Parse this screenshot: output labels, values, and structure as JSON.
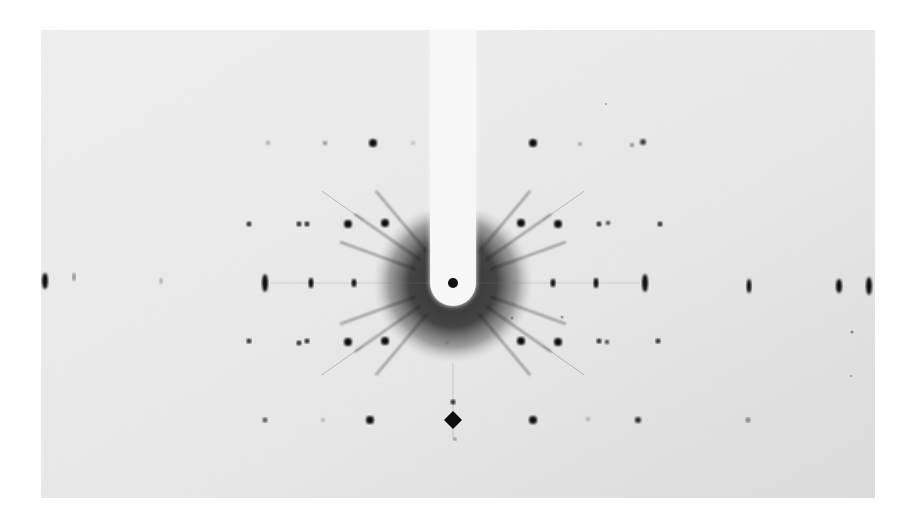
{
  "figure": {
    "kind": "x-ray diffraction photograph",
    "photo_rect": {
      "x": 41,
      "y": 30,
      "w": 834,
      "h": 468
    },
    "background_color": "#ececec",
    "page_color": "#ffffff",
    "center": {
      "x": 453,
      "y": 283
    },
    "halo": {
      "radius": 80,
      "color": "#3a3a3a"
    },
    "beam_stop": {
      "x": 453,
      "top": 30,
      "width": 46,
      "radius": 23,
      "color": "#f7f7f7"
    },
    "central_spot": {
      "x": 453,
      "y": 283,
      "r": 5
    },
    "streak_angles": [
      0,
      20,
      35,
      50,
      130,
      145,
      160,
      180,
      200,
      215,
      230,
      310,
      325,
      340
    ],
    "spots": [
      {
        "x": 268,
        "y": 143,
        "r": 2,
        "o": 0.35
      },
      {
        "x": 325,
        "y": 143,
        "r": 2,
        "o": 0.5
      },
      {
        "x": 373,
        "y": 143,
        "r": 4,
        "o": 1
      },
      {
        "x": 413,
        "y": 143,
        "r": 2,
        "o": 0.2
      },
      {
        "x": 533,
        "y": 143,
        "r": 4,
        "o": 1
      },
      {
        "x": 580,
        "y": 144,
        "r": 2,
        "o": 0.3
      },
      {
        "x": 632,
        "y": 145,
        "r": 2,
        "o": 0.5
      },
      {
        "x": 643,
        "y": 142,
        "r": 3,
        "o": 0.8
      },
      {
        "x": 249,
        "y": 224,
        "r": 2.5,
        "o": 0.9
      },
      {
        "x": 299,
        "y": 224,
        "r": 2.5,
        "o": 0.9
      },
      {
        "x": 307,
        "y": 224,
        "r": 2.5,
        "o": 0.9
      },
      {
        "x": 348,
        "y": 224,
        "r": 4,
        "o": 1
      },
      {
        "x": 385,
        "y": 223,
        "r": 4,
        "o": 1
      },
      {
        "x": 521,
        "y": 223,
        "r": 4,
        "o": 1
      },
      {
        "x": 558,
        "y": 224,
        "r": 4,
        "o": 1
      },
      {
        "x": 599,
        "y": 224,
        "r": 2.5,
        "o": 0.9
      },
      {
        "x": 608,
        "y": 223,
        "r": 2,
        "o": 0.9
      },
      {
        "x": 660,
        "y": 224,
        "r": 2.5,
        "o": 0.9
      },
      {
        "x": 249,
        "y": 341,
        "r": 2.5,
        "o": 0.9
      },
      {
        "x": 299,
        "y": 343,
        "r": 2.5,
        "o": 0.9
      },
      {
        "x": 307,
        "y": 341,
        "r": 2.5,
        "o": 0.9
      },
      {
        "x": 348,
        "y": 342,
        "r": 4,
        "o": 1
      },
      {
        "x": 385,
        "y": 341,
        "r": 4,
        "o": 1
      },
      {
        "x": 521,
        "y": 341,
        "r": 4,
        "o": 1
      },
      {
        "x": 558,
        "y": 342,
        "r": 4,
        "o": 1
      },
      {
        "x": 599,
        "y": 341,
        "r": 2.5,
        "o": 0.9
      },
      {
        "x": 607,
        "y": 342,
        "r": 2,
        "o": 0.9
      },
      {
        "x": 658,
        "y": 341,
        "r": 2.5,
        "o": 0.9
      },
      {
        "x": 447,
        "y": 343,
        "r": 2,
        "o": 0.15
      },
      {
        "x": 265,
        "y": 420,
        "r": 2.5,
        "o": 0.7
      },
      {
        "x": 323,
        "y": 420,
        "r": 2,
        "o": 0.25
      },
      {
        "x": 370,
        "y": 420,
        "r": 4,
        "o": 1
      },
      {
        "x": 533,
        "y": 420,
        "r": 4,
        "o": 1
      },
      {
        "x": 588,
        "y": 419,
        "r": 2,
        "o": 0.25
      },
      {
        "x": 638,
        "y": 420,
        "r": 3,
        "o": 0.9
      },
      {
        "x": 748,
        "y": 420,
        "r": 2.5,
        "o": 0.5
      },
      {
        "x": 453,
        "y": 402,
        "r": 2.5,
        "o": 0.9
      },
      {
        "x": 455,
        "y": 439,
        "r": 1.5,
        "o": 0.6
      }
    ],
    "elongated_spots": [
      {
        "x": 45,
        "y": 281,
        "rx": 3,
        "ry": 8,
        "o": 1
      },
      {
        "x": 74,
        "y": 277,
        "rx": 1.5,
        "ry": 4,
        "o": 0.5
      },
      {
        "x": 161,
        "y": 281,
        "rx": 1.5,
        "ry": 3,
        "o": 0.3
      },
      {
        "x": 265,
        "y": 283,
        "rx": 3,
        "ry": 9,
        "o": 1
      },
      {
        "x": 311,
        "y": 283,
        "rx": 2.5,
        "ry": 5,
        "o": 1
      },
      {
        "x": 354,
        "y": 283,
        "rx": 2.5,
        "ry": 4,
        "o": 1
      },
      {
        "x": 553,
        "y": 283,
        "rx": 2.5,
        "ry": 4,
        "o": 1
      },
      {
        "x": 596,
        "y": 283,
        "rx": 2.5,
        "ry": 5,
        "o": 1
      },
      {
        "x": 645,
        "y": 283,
        "rx": 3,
        "ry": 9,
        "o": 1
      },
      {
        "x": 749,
        "y": 286,
        "rx": 2.5,
        "ry": 7,
        "o": 1
      },
      {
        "x": 839,
        "y": 286,
        "rx": 3,
        "ry": 7,
        "o": 1
      },
      {
        "x": 869,
        "y": 286,
        "rx": 3,
        "ry": 9,
        "o": 1
      }
    ],
    "diamond_spot": {
      "x": 453,
      "y": 420,
      "size": 9
    },
    "faint_spots": [
      {
        "x": 512,
        "y": 318,
        "r": 1.5,
        "o": 0.4
      },
      {
        "x": 562,
        "y": 317,
        "r": 1.5,
        "o": 0.4
      },
      {
        "x": 852,
        "y": 332,
        "r": 1.5,
        "o": 0.5
      },
      {
        "x": 606,
        "y": 104,
        "r": 1,
        "o": 0.4
      },
      {
        "x": 851,
        "y": 376,
        "r": 1,
        "o": 0.4
      }
    ]
  }
}
